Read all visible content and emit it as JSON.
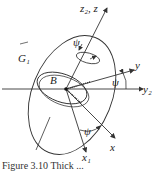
{
  "diagram": {
    "labels": {
      "z_axis": "z₂, z",
      "y_axis": "y",
      "y2_axis": "y₂",
      "x_axis": "x",
      "x1_axis": "x₁",
      "body_outer": "G₁",
      "body_inner": "B",
      "angle_psi_top": "ψ",
      "angle_psi_right": "ψ",
      "angle_psi_bottom": "ψ"
    },
    "colors": {
      "stroke": "#333333",
      "background": "#ffffff"
    }
  },
  "caption": {
    "text": "Figure 3.10   Thick ..."
  }
}
